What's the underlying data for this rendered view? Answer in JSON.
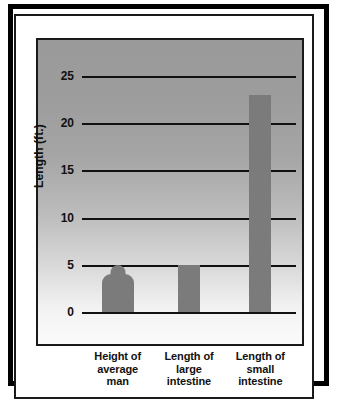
{
  "chart_data": {
    "type": "bar",
    "title": "",
    "subtitle": "",
    "xlabel": "",
    "ylabel": "Length (ft.)",
    "ylim": [
      0,
      26.5
    ],
    "yticks": [
      0,
      5,
      10,
      15,
      20,
      25
    ],
    "ytick_labels": [
      "0",
      "5",
      "10",
      "15",
      "20",
      "25"
    ],
    "grid": true,
    "legend": null,
    "categories": [
      "Height of average man",
      "Length of large intestine",
      "Length of small intestine"
    ],
    "category_lines": [
      [
        "Height of",
        "average",
        "man"
      ],
      [
        "Length of",
        "large",
        "intestine"
      ],
      [
        "Length of",
        "small",
        "intestine"
      ]
    ],
    "values": [
      5,
      5,
      23
    ],
    "bar_styles": [
      "person-silhouette",
      "rectangle",
      "rectangle"
    ],
    "bar_color": "#7b7b7b",
    "gridline_color": "#111111",
    "plot_background": "gradient-gray-to-white",
    "frame_color": "#1a1a1a"
  }
}
